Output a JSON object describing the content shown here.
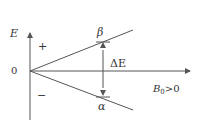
{
  "diagram": {
    "axis_y_label": "E",
    "axis_x_label_main": "B",
    "axis_x_label_sub": "0",
    "axis_x_label_tail": ">0",
    "origin_label": "0",
    "plus_label": "+",
    "minus_label": "−",
    "upper_state_label": "β",
    "lower_state_label": "α",
    "gap_label": "ΔE",
    "line_color": "#555555"
  }
}
